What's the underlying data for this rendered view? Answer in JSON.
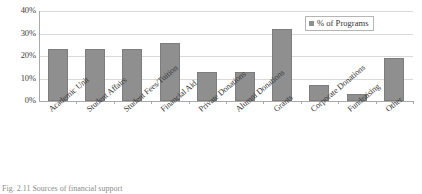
{
  "chart_data": {
    "type": "bar",
    "title": "",
    "xlabel": "",
    "ylabel": "",
    "ylim": [
      0,
      40
    ],
    "yticks": [
      "0%",
      "10%",
      "20%",
      "30%",
      "40%"
    ],
    "ytick_values": [
      0,
      10,
      20,
      30,
      40
    ],
    "grid": true,
    "legend_position": "top-right",
    "categories": [
      "Academic Unit",
      "Student Affairs",
      "Student Fees/Tuition",
      "Financial Aid",
      "Private Donations",
      "Alumni Donations",
      "Grants",
      "Corporate Donations",
      "Fundraising",
      "Other"
    ],
    "series": [
      {
        "name": "% of Programs",
        "color": "#8f8f8f",
        "values": [
          23,
          23,
          23,
          26,
          13,
          13,
          32,
          7,
          3,
          19
        ]
      }
    ]
  },
  "legend": {
    "label": "% of Programs",
    "swatch_color": "#8f8f8f"
  },
  "caption": {
    "text": "Fig. 2.11  Sources of financial support"
  }
}
